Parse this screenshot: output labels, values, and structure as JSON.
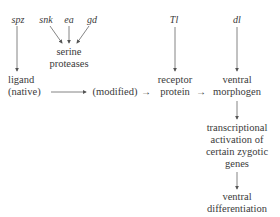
{
  "genes": {
    "spz": "spz",
    "snk": "snk",
    "ea": "ea",
    "gd": "gd",
    "tl": "Tl",
    "dl": "dl"
  },
  "nodes": {
    "serine_proteases": [
      "serine",
      "proteases"
    ],
    "ligand": [
      "ligand",
      "(native)"
    ],
    "modified": "(modified)",
    "receptor_protein": [
      "receptor",
      "protein"
    ],
    "ventral_morphogen": [
      "ventral",
      "morphogen"
    ],
    "transcriptional_activation": [
      "transcriptional",
      "activation of",
      "certain zygotic",
      "genes"
    ],
    "ventral_differentiation": [
      "ventral",
      "differentiation"
    ]
  },
  "arrows": {
    "short_arrow": "→"
  },
  "colors": {
    "text": "#3a3a3a",
    "line": "#555555",
    "background": "#ffffff"
  }
}
